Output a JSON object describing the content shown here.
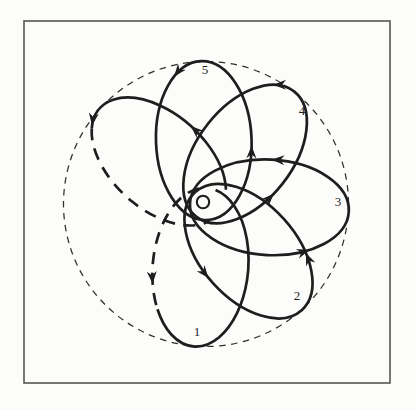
{
  "figure": {
    "description_type": "orbit-precession-rosette",
    "canvas": {
      "width": 416,
      "height": 410,
      "background": "#fcfcfa"
    },
    "ink_color": "#1e1e1e",
    "frame": {
      "x": 24,
      "y": 21,
      "width": 366,
      "height": 362,
      "stroke": "#555555",
      "stroke_width": 1.6
    },
    "boundary_circle": {
      "cx": 206,
      "cy": 204,
      "r": 142.5,
      "stroke": "#2f2f2f",
      "stroke_width": 1.25,
      "dash": "6.5 5.5"
    },
    "sun_symbol": {
      "cx": 203,
      "cy": 202,
      "r": 6.2,
      "stroke_width": 2.1,
      "fill": "#fcfcfa"
    },
    "orbit_model": {
      "focus_x": 206,
      "focus_y": 204,
      "semi_major": 79.5,
      "semi_minor": 47.8,
      "focal_offset": 63.5,
      "apoapsis_r": 143,
      "periapsis_r": 16,
      "stroke_width": 2.7,
      "dash": "12 8.5"
    },
    "petals": [
      {
        "label": "1",
        "angle": 95,
        "label_x": 197,
        "label_y": 336,
        "segments": [
          {
            "from": 170,
            "to": 55,
            "dashed": true
          },
          {
            "from": 55,
            "to": -170,
            "dashed": false
          }
        ]
      },
      {
        "label": "2",
        "angle": 48,
        "label_x": 297,
        "label_y": 300,
        "full": true
      },
      {
        "label": "3",
        "angle": 3,
        "label_x": 338,
        "label_y": 206,
        "full": true
      },
      {
        "label": "4",
        "angle": -52,
        "label_x": 302,
        "label_y": 115,
        "full": true
      },
      {
        "label": "5",
        "angle": -92,
        "label_x": 205,
        "label_y": 74,
        "full": true
      },
      {
        "label": "",
        "angle": -138,
        "segments": [
          {
            "from": 150,
            "to": -25,
            "dashed": false
          },
          {
            "from": -25,
            "to": -165,
            "dashed": true
          }
        ]
      }
    ],
    "label_font_size": 13,
    "arrowhead": {
      "length": 12.5,
      "half_width": 5,
      "notch": 8.5
    },
    "arrows": [
      {
        "petal": 0,
        "t": 75
      },
      {
        "petal": 1,
        "t": 95
      },
      {
        "petal": 1,
        "t": -60
      },
      {
        "petal": 2,
        "t": 58
      },
      {
        "petal": 2,
        "t": -90
      },
      {
        "petal": 3,
        "t": 100
      },
      {
        "petal": 3,
        "t": -25
      },
      {
        "petal": 4,
        "t": 95
      },
      {
        "petal": 4,
        "t": -35
      },
      {
        "petal": 5,
        "t": 90
      },
      {
        "petal": 5,
        "t": -22
      }
    ]
  }
}
